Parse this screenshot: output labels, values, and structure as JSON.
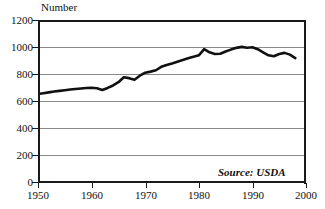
{
  "chart_data": {
    "type": "line",
    "title": "",
    "subtitle": "",
    "xlabel": "",
    "ylabel": "Number",
    "xlim": [
      1950,
      2000
    ],
    "ylim": [
      0,
      1200
    ],
    "xticks": [
      1950,
      1960,
      1970,
      1980,
      1990,
      2000
    ],
    "yticks": [
      0,
      200,
      400,
      600,
      800,
      1000,
      1200
    ],
    "grid": "horizontal",
    "legend": "none",
    "line_color": "#111111",
    "annotations": [
      {
        "name": "source-note",
        "text": "Source: USDA",
        "position": "bottom-right-inside"
      }
    ],
    "series": [
      {
        "name": "Number",
        "x": [
          1950,
          1951,
          1952,
          1953,
          1954,
          1955,
          1956,
          1957,
          1958,
          1959,
          1960,
          1961,
          1962,
          1963,
          1964,
          1965,
          1966,
          1967,
          1968,
          1969,
          1970,
          1971,
          1972,
          1973,
          1974,
          1975,
          1976,
          1977,
          1978,
          1979,
          1980,
          1981,
          1982,
          1983,
          1984,
          1985,
          1986,
          1987,
          1988,
          1989,
          1990,
          1991,
          1992,
          1993,
          1994,
          1995,
          1996,
          1997,
          1998
        ],
        "values": [
          655,
          661,
          667,
          673,
          678,
          683,
          688,
          692,
          696,
          699,
          701,
          697,
          685,
          700,
          718,
          742,
          778,
          772,
          760,
          790,
          812,
          820,
          830,
          855,
          868,
          880,
          893,
          905,
          918,
          930,
          940,
          985,
          962,
          950,
          952,
          968,
          982,
          995,
          1002,
          996,
          1000,
          985,
          962,
          940,
          933,
          950,
          958,
          945,
          920
        ]
      }
    ]
  },
  "axis": {
    "ylabel": "Number",
    "ytick_labels": [
      "1200",
      "1000",
      "800",
      "600",
      "400",
      "200",
      "0"
    ],
    "xtick_labels": [
      "1950",
      "1960",
      "1970",
      "1980",
      "1990",
      "2000"
    ]
  },
  "source": {
    "text": "Source: USDA"
  }
}
